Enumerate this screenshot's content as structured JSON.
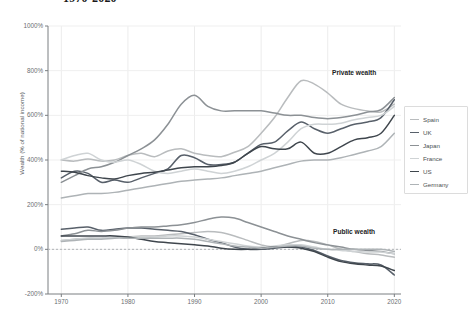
{
  "header": {
    "title": "1970-2020",
    "title_visible_fragment": "1970-2020"
  },
  "annotations": {
    "private": "Private wealth",
    "public": "Public wealth"
  },
  "legend": {
    "position": "right",
    "items": [
      {
        "label": "Spain",
        "color": "#b9bcbe"
      },
      {
        "label": "UK",
        "color": "#58606a"
      },
      {
        "label": "Japan",
        "color": "#8c9195"
      },
      {
        "label": "France",
        "color": "#cfd3d5"
      },
      {
        "label": "US",
        "color": "#3f464d"
      },
      {
        "label": "Germany",
        "color": "#aeb3b6"
      }
    ]
  },
  "chart_data": {
    "type": "line",
    "title": "1970-2020",
    "xlabel": "",
    "ylabel": "Wealth (% of national income)",
    "xlim": [
      1968,
      2021
    ],
    "ylim": [
      -200,
      1000
    ],
    "yticks": [
      1000,
      800,
      600,
      400,
      200,
      0,
      -200
    ],
    "ytick_labels": [
      "1000%",
      "800%",
      "600%",
      "400%",
      "200%",
      "0%",
      "-200%"
    ],
    "xticks": [
      1970,
      1980,
      1990,
      2000,
      2010,
      2020
    ],
    "xtick_labels": [
      "1970",
      "1980",
      "1990",
      "2000",
      "2010",
      "2020"
    ],
    "grid": true,
    "zero_line": 0,
    "x": [
      1970,
      1972,
      1974,
      1976,
      1978,
      1980,
      1982,
      1984,
      1986,
      1988,
      1990,
      1992,
      1994,
      1996,
      1998,
      2000,
      2002,
      2004,
      2006,
      2008,
      2010,
      2012,
      2014,
      2016,
      2018,
      2020
    ],
    "groups": [
      {
        "name": "Private wealth",
        "series": [
          {
            "name": "Spain",
            "color": "#b9bcbe",
            "width": 1.5,
            "values": [
              400,
              395,
              405,
              395,
              400,
              420,
              430,
              415,
              440,
              450,
              430,
              420,
              415,
              435,
              460,
              520,
              590,
              680,
              755,
              740,
              700,
              650,
              630,
              620,
              615,
              650
            ]
          },
          {
            "name": "UK",
            "color": "#58606a",
            "width": 1.5,
            "values": [
              320,
              350,
              340,
              300,
              310,
              300,
              320,
              340,
              360,
              420,
              410,
              380,
              380,
              390,
              430,
              470,
              480,
              530,
              570,
              540,
              520,
              540,
              560,
              570,
              590,
              670
            ]
          },
          {
            "name": "Japan",
            "color": "#8c9195",
            "width": 1.5,
            "values": [
              300,
              330,
              360,
              370,
              390,
              420,
              450,
              490,
              560,
              650,
              690,
              640,
              620,
              620,
              620,
              620,
              610,
              600,
              600,
              590,
              585,
              590,
              600,
              615,
              625,
              680
            ]
          },
          {
            "name": "France",
            "color": "#cfd3d5",
            "width": 1.5,
            "values": [
              400,
              420,
              430,
              400,
              390,
              400,
              380,
              350,
              340,
              350,
              360,
              350,
              340,
              350,
              370,
              400,
              430,
              480,
              540,
              560,
              560,
              565,
              580,
              590,
              600,
              640
            ]
          },
          {
            "name": "US",
            "color": "#3f464d",
            "width": 1.5,
            "values": [
              350,
              345,
              330,
              320,
              315,
              330,
              340,
              345,
              355,
              365,
              370,
              370,
              375,
              390,
              430,
              460,
              450,
              450,
              480,
              430,
              430,
              460,
              490,
              500,
              520,
              600
            ]
          },
          {
            "name": "Germany",
            "color": "#aeb3b6",
            "width": 1.5,
            "values": [
              230,
              240,
              250,
              250,
              255,
              265,
              275,
              285,
              295,
              305,
              310,
              315,
              320,
              330,
              340,
              350,
              365,
              380,
              395,
              400,
              400,
              410,
              425,
              440,
              460,
              520
            ]
          }
        ]
      },
      {
        "name": "Public wealth",
        "series": [
          {
            "name": "Spain",
            "color": "#b9bcbe",
            "width": 1.5,
            "values": [
              40,
              45,
              50,
              50,
              55,
              55,
              60,
              60,
              65,
              70,
              75,
              80,
              75,
              60,
              40,
              20,
              10,
              25,
              40,
              35,
              20,
              0,
              -10,
              -20,
              -25,
              -35
            ]
          },
          {
            "name": "UK",
            "color": "#58606a",
            "width": 1.5,
            "values": [
              90,
              95,
              100,
              85,
              90,
              95,
              95,
              90,
              85,
              80,
              65,
              45,
              30,
              10,
              0,
              0,
              5,
              10,
              10,
              -5,
              -30,
              -50,
              -60,
              -65,
              -70,
              -115
            ]
          },
          {
            "name": "Japan",
            "color": "#8c9195",
            "width": 1.5,
            "values": [
              60,
              70,
              85,
              80,
              85,
              95,
              100,
              100,
              105,
              110,
              120,
              135,
              145,
              140,
              120,
              100,
              80,
              60,
              45,
              30,
              20,
              10,
              0,
              -5,
              -10,
              -20
            ]
          },
          {
            "name": "France",
            "color": "#cfd3d5",
            "width": 1.5,
            "values": [
              40,
              45,
              50,
              50,
              55,
              55,
              55,
              55,
              60,
              60,
              55,
              45,
              35,
              25,
              15,
              10,
              15,
              20,
              20,
              10,
              0,
              -5,
              -10,
              -12,
              -12,
              -20
            ]
          },
          {
            "name": "US",
            "color": "#3f464d",
            "width": 1.5,
            "values": [
              60,
              60,
              60,
              60,
              60,
              55,
              45,
              35,
              30,
              25,
              20,
              15,
              5,
              0,
              0,
              5,
              10,
              10,
              5,
              -10,
              -35,
              -55,
              -65,
              -70,
              -75,
              -95
            ]
          },
          {
            "name": "Germany",
            "color": "#aeb3b6",
            "width": 1.5,
            "values": [
              35,
              40,
              45,
              45,
              50,
              50,
              50,
              50,
              50,
              50,
              45,
              35,
              25,
              15,
              10,
              5,
              10,
              15,
              15,
              5,
              0,
              0,
              0,
              0,
              0,
              -10
            ]
          }
        ]
      }
    ]
  }
}
